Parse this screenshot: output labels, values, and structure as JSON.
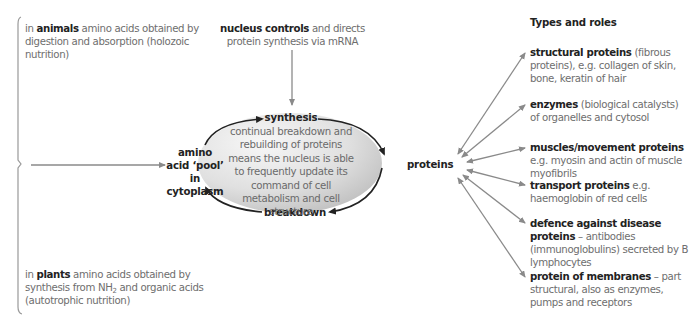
{
  "sources": {
    "animals": {
      "prefix": "in ",
      "bold": "animals",
      "rest": " amino acids obtained by digestion and absorption (holozoic nutrition)"
    },
    "plants": {
      "prefix": "in ",
      "bold": "plants",
      "rest_before_sub": " amino acids obtained by synthesis from NH",
      "subscript": "2",
      "rest_after_sub": " and organic acids (autotrophic nutrition)"
    }
  },
  "nucleus": {
    "bold": "nucleus controls",
    "rest": " and directs protein synthesis via mRNA"
  },
  "pool": {
    "label": "amino acid ‘pool’ in cytoplasm"
  },
  "cycle": {
    "top_label": "synthesis",
    "bottom_label": "breakdown",
    "center_text": "continual breakdown and rebuilding of proteins means the nucleus is able to frequently update its command of cell metabolism and cell structure",
    "fill_light": "#f2f2f2",
    "fill_dark": "#bdbdbd"
  },
  "proteins": {
    "label": "proteins"
  },
  "roles": {
    "heading": "Types and roles",
    "items": [
      {
        "bold": "structural proteins",
        "rest": " (fibrous proteins), e.g. collagen of skin, bone, keratin of hair"
      },
      {
        "bold": "enzymes",
        "rest": " (biological catalysts) of organelles and cytosol"
      },
      {
        "bold": "muscles/movement proteins",
        "rest": " e.g. myosin and actin of muscle myofibrils"
      },
      {
        "bold": "transport proteins",
        "rest": " e.g. haemoglobin of red cells"
      },
      {
        "bold": "defence against disease proteins",
        "rest": " – antibodies (immunoglobulins) secreted by B lymphocytes"
      },
      {
        "bold": "protein of membranes",
        "rest": " – part structural, also as enzymes, pumps and receptors"
      }
    ]
  },
  "colors": {
    "arrow_grey": "#8a8a8a",
    "arrow_dark": "#222222",
    "text_bold": "#222222",
    "text_body": "#6e6e6e"
  }
}
